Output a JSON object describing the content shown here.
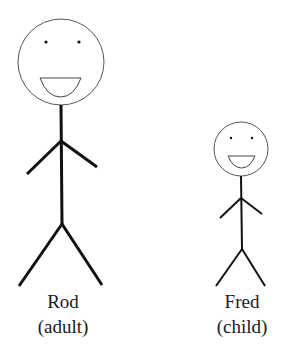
{
  "figures": [
    {
      "id": "rod",
      "name": "Rod",
      "role": "(adult)",
      "head": {
        "cx": 61,
        "cy": 62,
        "r": 43
      },
      "eyes": [
        {
          "cx": 46,
          "cy": 42
        },
        {
          "cx": 79,
          "cy": 42
        }
      ],
      "mouth": {
        "x1": 40,
        "x2": 81,
        "y": 78,
        "depth": 19
      },
      "body": {
        "neck": [
          61,
          105
        ],
        "shoulder": [
          61,
          141
        ],
        "hip": [
          62,
          224
        ]
      },
      "arms": {
        "left": [
          27,
          174
        ],
        "right": [
          97,
          167
        ]
      },
      "legs": {
        "left": [
          19,
          286
        ],
        "right": [
          102,
          285
        ]
      }
    },
    {
      "id": "fred",
      "name": "Fred",
      "role": "(child)",
      "head": {
        "cx": 241,
        "cy": 149,
        "r": 27
      },
      "eyes": [
        {
          "cx": 231,
          "cy": 138
        },
        {
          "cx": 252,
          "cy": 138
        }
      ],
      "mouth": {
        "x1": 228,
        "x2": 255,
        "y": 156,
        "depth": 12
      },
      "body": {
        "neck": [
          241,
          176
        ],
        "shoulder": [
          241,
          198
        ],
        "hip": [
          242,
          249
        ]
      },
      "arms": {
        "left": [
          220,
          218
        ],
        "right": [
          262,
          214
        ]
      },
      "legs": {
        "left": [
          216,
          286
        ],
        "right": [
          265,
          286
        ]
      }
    }
  ],
  "colors": {
    "line": "#111111",
    "head_outline": "#555555",
    "text": "#1a1a1a"
  }
}
